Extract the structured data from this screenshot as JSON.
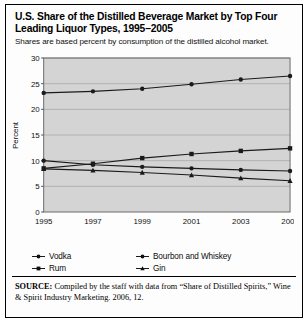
{
  "figure": {
    "title": "U.S. Share of the Distilled Beverage Market by Top Four Leading Liquor Types, 1995–2005",
    "subtitle": "Shares are based percent by consumption of the distilled alcohol market.",
    "source_prefix": "SOURCE:",
    "source_text": " Compiled by the staff with data from “Share of Distilled Spirits,” Wine & Spirit Industry Marketing. 2006, 12.",
    "plot_background": "#d4d4d4",
    "line_color": "#1a1a1a",
    "grid_color": "#a8a8a8",
    "border_color": "#6b6b6b"
  },
  "chart_data": {
    "type": "line",
    "title": "U.S. Share of the Distilled Beverage Market by Top Four Leading Liquor Types, 1995–2005",
    "subtitle": "Shares are based percent by consumption of the distilled alcohol market.",
    "xlabel": "",
    "ylabel": "Percent",
    "x": [
      1995,
      1997,
      1999,
      2001,
      2003,
      2005
    ],
    "xtick_labels": [
      "1995",
      "1997",
      "1999",
      "2001",
      "2003",
      "2005"
    ],
    "ytick_labels": [
      "0",
      "5",
      "10",
      "15",
      "20",
      "25",
      "30"
    ],
    "yticks": [
      0,
      5,
      10,
      15,
      20,
      25,
      30
    ],
    "ylim": [
      0,
      30
    ],
    "grid": true,
    "legend_position": "below",
    "series": [
      {
        "name": "Vodka",
        "marker": "circle",
        "values": [
          23.2,
          23.5,
          24.0,
          24.9,
          25.8,
          26.5
        ]
      },
      {
        "name": "Bourbon and Whiskey",
        "marker": "square",
        "values": [
          8.5,
          9.4,
          10.5,
          11.3,
          11.9,
          12.4
        ]
      },
      {
        "name": "Rum",
        "marker": "circle",
        "values": [
          10.0,
          9.2,
          8.8,
          8.5,
          8.2,
          8.0
        ]
      },
      {
        "name": "Gin",
        "marker": "triangle",
        "values": [
          8.4,
          8.1,
          7.7,
          7.2,
          6.6,
          6.1
        ]
      }
    ]
  },
  "legend": [
    {
      "label": "Vodka",
      "marker": "circle"
    },
    {
      "label": "Bourbon and Whiskey",
      "marker": "circle"
    },
    {
      "label": "Rum",
      "marker": "square"
    },
    {
      "label": "Gin",
      "marker": "triangle"
    }
  ]
}
